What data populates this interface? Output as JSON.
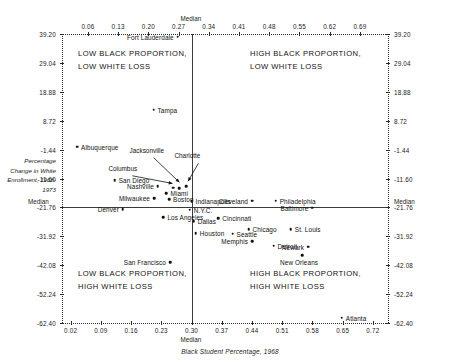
{
  "chart_data": {
    "type": "scatter",
    "title": "",
    "xlabel": "Black Student Percentage, 1968",
    "ylabel": "Percentage Change in White Enrollment, 1968-1973",
    "xlim": [
      0.0,
      0.755
    ],
    "ylim": [
      -62.4,
      39.2
    ],
    "grid": false,
    "legend": "none",
    "median_x": 0.3,
    "median_y": -21.76,
    "median_label": "Median",
    "x_ticks_top": [
      "0.06",
      "0.13",
      "0.20",
      "0.27",
      "0.34",
      "0.41",
      "0.48",
      "0.55",
      "0.62",
      "0.69"
    ],
    "x_tick_values_top": [
      0.06,
      0.13,
      0.2,
      0.27,
      0.34,
      0.41,
      0.48,
      0.55,
      0.62,
      0.69
    ],
    "x_ticks_bottom": [
      "0.02",
      "0.09",
      "0.16",
      "0.23",
      "0.30",
      "0.37",
      "0.44",
      "0.51",
      "0.58",
      "0.65",
      "0.72"
    ],
    "x_tick_values_bottom": [
      0.02,
      0.09,
      0.16,
      0.23,
      0.3,
      0.37,
      0.44,
      0.51,
      0.58,
      0.65,
      0.72
    ],
    "y_ticks": [
      "39.20",
      "29.04",
      "18.88",
      "8.72",
      "-1.44",
      "-11.60",
      "-21.76",
      "-31.92",
      "-42.08",
      "-52.24",
      "-62.40"
    ],
    "y_tick_values": [
      39.2,
      29.04,
      18.88,
      8.72,
      -1.44,
      -11.6,
      -21.76,
      -31.92,
      -42.08,
      -52.24,
      -62.4
    ],
    "quadrants": [
      {
        "id": "top-left",
        "text": "LOW BLACK PROPORTION,\nLOW WHITE LOSS"
      },
      {
        "id": "top-right",
        "text": "HIGH BLACK PROPORTION,\nLOW WHITE LOSS"
      },
      {
        "id": "bottom-left",
        "text": "LOW BLACK PROPORTION,\nHIGH WHITE LOSS"
      },
      {
        "id": "bottom-right",
        "text": "HIGH BLACK PROPORTION,\nHIGH WHITE LOSS"
      }
    ],
    "points": [
      {
        "name": "Fort Lauderdale",
        "x": 0.268,
        "y": 38.2,
        "side": "left"
      },
      {
        "name": "Tampa",
        "x": 0.212,
        "y": 12.6,
        "side": "right"
      },
      {
        "name": "Albuquerque",
        "x": 0.035,
        "y": -0.4,
        "side": "right"
      },
      {
        "name": "San Diego",
        "x": 0.122,
        "y": -12.1,
        "side": "right"
      },
      {
        "name": "Nashville",
        "x": 0.222,
        "y": -14.4,
        "side": "left"
      },
      {
        "name": "Miami",
        "x": 0.242,
        "y": -16.8,
        "side": "right"
      },
      {
        "name": "Milwaukee",
        "x": 0.213,
        "y": -18.6,
        "side": "left"
      },
      {
        "name": "Boston",
        "x": 0.248,
        "y": -18.8,
        "side": "right"
      },
      {
        "name": "Indianapolis",
        "x": 0.3,
        "y": -19.6,
        "side": "right"
      },
      {
        "name": "N.Y.C.",
        "x": 0.296,
        "y": -22.6,
        "side": "right"
      },
      {
        "name": "Denver",
        "x": 0.141,
        "y": -22.4,
        "side": "left"
      },
      {
        "name": "Los Angeles",
        "x": 0.235,
        "y": -25.2,
        "side": "right"
      },
      {
        "name": "Dallas",
        "x": 0.305,
        "y": -26.6,
        "side": "right"
      },
      {
        "name": "Houston",
        "x": 0.31,
        "y": -30.8,
        "side": "right"
      },
      {
        "name": "San Francisco",
        "x": 0.25,
        "y": -41.0,
        "side": "left"
      },
      {
        "name": "Cleveland",
        "x": 0.44,
        "y": -19.4,
        "side": "left"
      },
      {
        "name": "Philadelphia",
        "x": 0.495,
        "y": -19.4,
        "side": "right"
      },
      {
        "name": "Baltimore",
        "x": 0.58,
        "y": -21.9,
        "side": "left"
      },
      {
        "name": "Cincinnati",
        "x": 0.362,
        "y": -25.6,
        "side": "right"
      },
      {
        "name": "Chicago",
        "x": 0.432,
        "y": -29.4,
        "side": "right"
      },
      {
        "name": "St. Louis",
        "x": 0.53,
        "y": -29.4,
        "side": "right"
      },
      {
        "name": "Seattle",
        "x": 0.395,
        "y": -31.0,
        "side": "right"
      },
      {
        "name": "Memphis",
        "x": 0.44,
        "y": -33.6,
        "side": "left"
      },
      {
        "name": "Detroit",
        "x": 0.49,
        "y": -35.2,
        "side": "right"
      },
      {
        "name": "Newark",
        "x": 0.57,
        "y": -35.6,
        "side": "left"
      },
      {
        "name": "New Orleans",
        "x": 0.556,
        "y": -38.6,
        "side": "below"
      },
      {
        "name": "Atlanta",
        "x": 0.648,
        "y": -60.6,
        "side": "right"
      },
      {
        "name": "Columbus",
        "x": 0.258,
        "y": -14.9,
        "side": "annotated"
      },
      {
        "name": "Jacksonville",
        "x": 0.272,
        "y": -15.0,
        "side": "annotated"
      },
      {
        "name": "Charlotte",
        "x": 0.288,
        "y": -14.4,
        "side": "annotated"
      }
    ],
    "annotations": [
      {
        "label": "Columbus",
        "label_x": 0.163,
        "label_y": -9.6,
        "target_x": 0.256,
        "target_y": -14.4
      },
      {
        "label": "Jacksonville",
        "label_x": 0.212,
        "label_y": -3.2,
        "target_x": 0.272,
        "target_y": -14.0
      },
      {
        "label": "Charlotte",
        "label_x": 0.316,
        "label_y": -5.2,
        "target_x": 0.292,
        "target_y": -13.6
      }
    ]
  }
}
